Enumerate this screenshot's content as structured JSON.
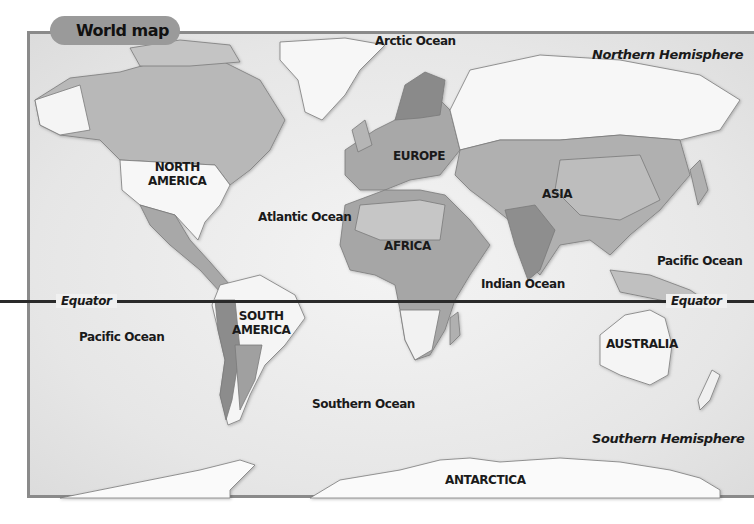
{
  "title": "World map",
  "continents": [
    {
      "id": "north-america",
      "label": "NORTH\nAMERICA",
      "lines": [
        "NORTH",
        "AMERICA"
      ]
    },
    {
      "id": "south-america",
      "label": "SOUTH\nAMERICA",
      "lines": [
        "SOUTH",
        "AMERICA"
      ]
    },
    {
      "id": "europe",
      "label": "EUROPE",
      "lines": [
        "EUROPE"
      ]
    },
    {
      "id": "africa",
      "label": "AFRICA",
      "lines": [
        "AFRICA"
      ]
    },
    {
      "id": "asia",
      "label": "ASIA",
      "lines": [
        "ASIA"
      ]
    },
    {
      "id": "australia",
      "label": "AUSTRALIA",
      "lines": [
        "AUSTRALIA"
      ]
    },
    {
      "id": "antarctica",
      "label": "ANTARCTICA",
      "lines": [
        "ANTARCTICA"
      ]
    }
  ],
  "oceans": {
    "arctic": "Arctic Ocean",
    "atlantic": "Atlantic Ocean",
    "pacific_west": "Pacific Ocean",
    "pacific_east": "Pacific Ocean",
    "indian": "Indian Ocean",
    "southern": "Southern Ocean"
  },
  "hemispheres": {
    "northern": "Northern Hemisphere",
    "southern": "Southern Hemisphere"
  },
  "equator": {
    "label_left": "Equator",
    "label_right": "Equator"
  },
  "colors": {
    "frame": "#8a8a8a",
    "title_tab": "#9a9a9a",
    "land_light": "#f7f7f7",
    "land_mid": "#b5b5b5",
    "land_dark": "#8c8c8c",
    "equator_line": "#2a2a2a"
  }
}
